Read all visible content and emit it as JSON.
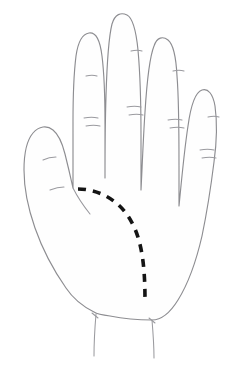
{
  "figure": {
    "view": "palmar",
    "background_color": "#ffffff",
    "outline_color": "#8d8d91",
    "crease_color": "#9a9a9f",
    "marker_color": "#141414",
    "canvas": {
      "width": 246,
      "height": 368
    }
  },
  "annotations": {
    "dashed_marker": {
      "label": "dashed-boundary-line",
      "style": "dashed",
      "color": "#141414",
      "stroke_width": 3.6,
      "dash_pattern": "8 7",
      "start_point": {
        "x": 78,
        "y": 189
      },
      "end_point": {
        "x": 145,
        "y": 300
      },
      "path": "M 78 189 C 96 189 116 198 128 216 C 140 234 145 258 145 300"
    }
  },
  "anatomy": {
    "parts": [
      {
        "name": "thumb",
        "label": "Thumb",
        "tip": {
          "x": 38,
          "y": 130
        },
        "creases": 2
      },
      {
        "name": "index-finger",
        "label": "Index finger",
        "tip": {
          "x": 89,
          "y": 33
        },
        "creases": 3
      },
      {
        "name": "middle-finger",
        "label": "Middle finger",
        "tip": {
          "x": 136,
          "y": 15
        },
        "creases": 3
      },
      {
        "name": "ring-finger",
        "label": "Ring finger",
        "tip": {
          "x": 180,
          "y": 36
        },
        "creases": 3
      },
      {
        "name": "little-finger",
        "label": "Little finger",
        "tip": {
          "x": 215,
          "y": 90
        },
        "creases": 3
      },
      {
        "name": "palm",
        "label": "Palm",
        "creases": 0
      },
      {
        "name": "wrist",
        "label": "Wrist",
        "creases": 2
      }
    ]
  },
  "paths": {
    "hand_outline": "M 94 312 C 80 305 72 297 66 288 C 52 268 42 248 35 228 C 28 208 24 190 24 170 C 24 152 27 140 33 133 C 39 126 47 125 53 130 C 58 134 62 142 65 154 C 68 166 71 179 73 188 C 73 170 73 148 73 122 C 73 96 74 72 76 56 C 78 42 82 34 89 33 C 96 32 100 40 102 56 C 104 72 105 98 105 124 C 105 148 105 166 105 178 C 105 160 105 128 106 96 C 107 62 109 36 112 24 C 115 14 121 12 127 15 C 133 18 136 30 138 50 C 140 72 141 104 141 136 C 141 162 141 178 141 190 C 142 172 143 142 145 112 C 147 80 150 56 154 46 C 157 37 163 36 168 40 C 173 44 176 56 177 76 C 179 100 179 136 179 166 C 179 186 179 198 179 206 C 181 186 184 152 188 126 C 191 104 196 92 202 90 C 208 88 213 94 215 106 C 217 120 217 140 214 162 C 211 186 207 212 202 236 C 196 262 188 284 178 300 C 170 313 161 320 152 320 C 140 320 120 318 110 316 C 102 315 97 314 94 312 Z",
    "wrist_left": "M 96 314 C 95 326 94 340 94 356",
    "wrist_right": "M 152 320 C 153 332 154 344 154 358",
    "wrist_notch_left": "M 92 313 L 98 318",
    "wrist_notch_right": "M 149 318 L 155 323",
    "web_index_thumb": "M 73 188 C 77 196 82 204 90 214",
    "creases": [
      "M 43 160 C 47 158 52 157 56 157",
      "M 50 190 C 55 188 60 187 64 187",
      "M 86 76 C 90 75 94 75 97 76",
      "M 84 118 C 89 117 94 117 98 118",
      "M 86 126 C 91 125 96 125 100 126",
      "M 131 51 C 135 50 139 50 142 51",
      "M 127 107 C 132 106 137 106 141 107",
      "M 129 115 C 134 114 139 114 143 115",
      "M 173 71 C 177 70 181 70 184 71",
      "M 168 120 C 173 119 178 119 182 120",
      "M 170 128 C 175 127 180 127 184 128",
      "M 208 117 C 212 116 216 116 219 117",
      "M 200 150 C 205 149 210 149 214 150",
      "M 202 158 C 207 157 212 157 216 158"
    ]
  }
}
